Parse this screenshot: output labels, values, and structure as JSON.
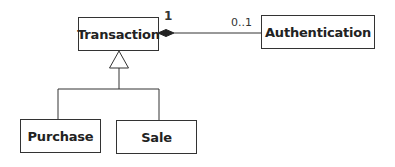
{
  "diagram": {
    "type": "uml-class-diagram",
    "classes": [
      {
        "id": "transaction",
        "name": "Transaction"
      },
      {
        "id": "authentication",
        "name": "Authentication"
      },
      {
        "id": "purchase",
        "name": "Purchase"
      },
      {
        "id": "sale",
        "name": "Sale"
      }
    ],
    "relationships": [
      {
        "type": "composition",
        "whole": "Transaction",
        "part": "Authentication",
        "whole_multiplicity": "1",
        "part_multiplicity": "0..1"
      },
      {
        "type": "generalization",
        "parent": "Transaction",
        "children": [
          "Purchase",
          "Sale"
        ]
      }
    ]
  },
  "labels": {
    "transaction": "Transaction",
    "authentication": "Authentication",
    "purchase": "Purchase",
    "sale": "Sale",
    "mult_whole": "1",
    "mult_part": "0..1"
  },
  "colors": {
    "line": "#333333",
    "background": "#ffffff",
    "text": "#222222"
  }
}
